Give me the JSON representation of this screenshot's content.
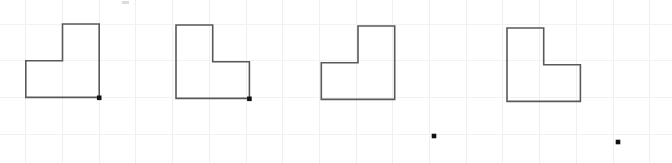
{
  "canvas": {
    "width": 672,
    "height": 163,
    "background": "#ffffff",
    "description": "Four L-shaped polygons drawn on a faint graph-paper grid, with small black square dot markers"
  },
  "grid": {
    "label": "graph-paper-grid",
    "cell_size": 36.7,
    "origin_x": 25.8,
    "origin_y": 24.0,
    "color_vertical": "#efefef",
    "color_horizontal": "#f2f2f2",
    "vertical_lines": [
      25.8,
      62.5,
      99.2,
      135.9,
      172.6,
      209.3,
      246.0,
      282.7,
      319.4,
      356.1,
      392.8,
      429.5,
      466.2,
      502.9,
      539.6,
      576.3,
      613.0,
      649.7
    ],
    "horizontal_lines": [
      24.0,
      60.7,
      97.4,
      134.1
    ],
    "show": true
  },
  "style": {
    "shape_stroke": "#595959",
    "shape_stroke_width": 1.6,
    "dot_color": "#111111",
    "dot_size": 4.6
  },
  "shapes": [
    {
      "name": "shape-1-l-polygon",
      "label": "L shape 1",
      "orientation": "notch-top-left",
      "points": "62.5,24.0 99.2,24.0 99.2,97.4 25.8,97.4 25.8,60.7 62.5,60.7",
      "bbox": {
        "x": 25.8,
        "y": 24.0,
        "width": 73.4,
        "height": 73.4
      }
    },
    {
      "name": "shape-2-l-polygon",
      "label": "L shape 2",
      "orientation": "notch-bottom-right",
      "points": "176.0,25.0 212.7,25.0 212.7,61.7 249.4,61.7 249.4,98.4 176.0,98.4"
    },
    {
      "name": "shape-3-l-polygon",
      "label": "L shape 3",
      "orientation": "notch-top-left",
      "points": "358.0,26.0 394.7,26.0 394.7,99.4 321.3,99.4 321.3,62.7 358.0,62.7"
    },
    {
      "name": "shape-4-l-polygon",
      "label": "L shape 4",
      "orientation": "notch-bottom-right",
      "points": "507.0,28.0 543.7,28.0 543.7,64.7 580.4,64.7 580.4,101.4 507.0,101.4"
    }
  ],
  "dots": [
    {
      "name": "dot-shape-1-corner",
      "x": 99.2,
      "y": 97.8,
      "attached_to": "shape-1-l-polygon"
    },
    {
      "name": "dot-shape-2-corner",
      "x": 249.4,
      "y": 98.8,
      "attached_to": "shape-2-l-polygon"
    },
    {
      "name": "dot-free-1",
      "x": 434.0,
      "y": 136.0,
      "attached_to": null
    },
    {
      "name": "dot-free-2",
      "x": 618.0,
      "y": 142.0,
      "attached_to": null
    }
  ],
  "marks": [
    {
      "name": "top-edge-artifact",
      "x": 122.0,
      "y": 1.0,
      "width": 7,
      "height": 3,
      "color": "#dddddd"
    }
  ]
}
